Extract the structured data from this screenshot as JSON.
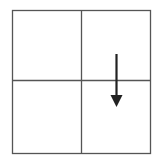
{
  "diagram": {
    "grid": {
      "left": 12.5,
      "top": 10.5,
      "right": 150.5,
      "bottom": 153.5,
      "center_x": 81.5,
      "center_y": 80.5,
      "stroke": "#555555",
      "stroke_width": 1.3
    },
    "cells": [
      {
        "row": 0,
        "col": 0,
        "content": ""
      },
      {
        "row": 0,
        "col": 1,
        "content": ""
      },
      {
        "row": 1,
        "col": 0,
        "content": ""
      },
      {
        "row": 1,
        "col": 1,
        "content": ""
      }
    ],
    "arrow": {
      "icon": "arrow-down-icon",
      "x": 116.5,
      "y_start": 54,
      "y_shaft_end": 97,
      "head_tip_y": 107,
      "head_half_width": 6,
      "color": "#222222",
      "stroke_width": 2.2
    }
  }
}
